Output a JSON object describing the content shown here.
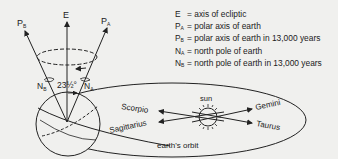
{
  "diagram": {
    "labels": {
      "E": "E",
      "PA": "P",
      "PA_sub": "A",
      "PB": "P",
      "PB_sub": "B",
      "NA": "N",
      "NA_sub": "A",
      "NB": "N",
      "NB_sub": "B",
      "angle": "23½°",
      "sun": "sun",
      "orbit": "earth's orbit",
      "scorpio": "Scorpio",
      "sagittarius": "Sagittarius",
      "gemini": "Gemini",
      "taurus": "Taurus"
    },
    "legend": [
      {
        "symbol": "E",
        "sub": "",
        "text": "= axis of ecliptic"
      },
      {
        "symbol": "P",
        "sub": "A",
        "text": "= polar axis of earth"
      },
      {
        "symbol": "P",
        "sub": "B",
        "text": "= polar axis of earth in 13,000 years"
      },
      {
        "symbol": "N",
        "sub": "A",
        "text": "= north pole of earth"
      },
      {
        "symbol": "N",
        "sub": "B",
        "text": "= north pole of earth in 13,000 years"
      }
    ],
    "colors": {
      "background": "#f0f0ee",
      "ink": "#222222"
    }
  }
}
